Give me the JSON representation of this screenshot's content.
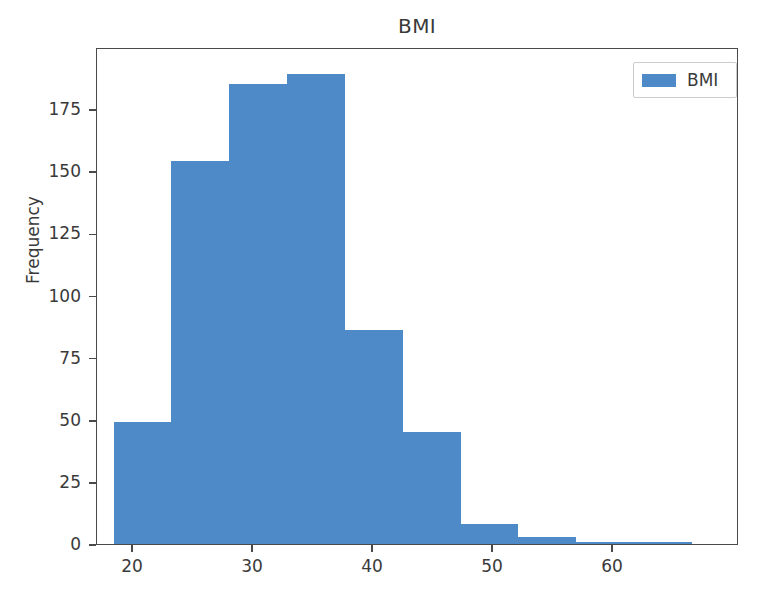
{
  "chart_data": {
    "type": "bar",
    "title": "BMI",
    "xlabel": "",
    "ylabel": "Frequency",
    "grid": false,
    "legend_position": "upper right",
    "legend_entries": [
      "BMI"
    ],
    "xlim": [
      17.0,
      70.5
    ],
    "ylim": [
      0,
      200
    ],
    "xticks": [
      20,
      30,
      40,
      50,
      60
    ],
    "xtick_labels": [
      "20",
      "30",
      "40",
      "50",
      "60"
    ],
    "yticks": [
      0,
      25,
      50,
      75,
      100,
      125,
      150,
      175
    ],
    "ytick_labels": [
      "0",
      "25",
      "50",
      "75",
      "100",
      "125",
      "150",
      "175"
    ],
    "bin_edges": [
      18.4,
      23.2,
      28.0,
      32.8,
      37.7,
      42.5,
      47.3,
      52.1,
      56.9,
      61.8,
      66.6
    ],
    "categories": [
      "18.4-23.2",
      "23.2-28.0",
      "28.0-32.8",
      "32.8-37.7",
      "37.7-42.5",
      "42.5-47.3",
      "47.3-52.1",
      "52.1-56.9",
      "56.9-61.8",
      "61.8-66.6"
    ],
    "values": [
      49,
      154,
      185,
      189,
      86,
      45,
      8,
      3,
      1,
      1
    ],
    "series": [
      {
        "name": "BMI",
        "color": "#4e89c8",
        "values": [
          49,
          154,
          185,
          189,
          86,
          45,
          8,
          3,
          1,
          1
        ]
      }
    ]
  },
  "colors": {
    "bar": "#4e89c8",
    "axis": "#4a4a4a",
    "text": "#3a3a3a",
    "background": "#ffffff",
    "legend_border": "#cccccc"
  }
}
